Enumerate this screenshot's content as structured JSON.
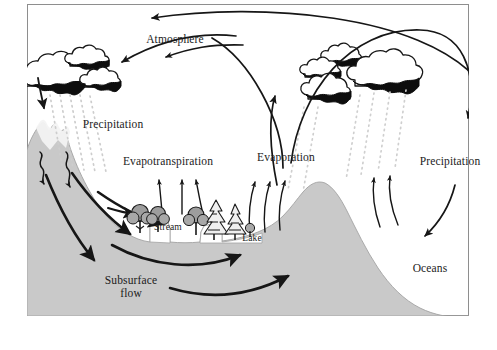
{
  "figure": {
    "type": "hydrologic-cycle-diagram",
    "border_color": "#8c8c8c",
    "background_color": "#ffffff",
    "ground_fill": "#c9c9c9",
    "ground_stroke": "#9a9a9a",
    "ink_color": "#161616",
    "precip_dot_color": "#cfcfcf"
  },
  "labels": {
    "atmosphere": "Atmosphere",
    "precipitation_left": "Precipitation",
    "evapotranspiration": "Evapotranspiration",
    "evaporation": "Evaporation",
    "precipitation_right": "Precipitation",
    "stream": "Stream",
    "lake": "Lake",
    "oceans": "Oceans",
    "subsurface_flow_line1": "Subsurface",
    "subsurface_flow_line2": "flow"
  },
  "elements": {
    "clouds_left_count": 3,
    "clouds_right_count": 4,
    "trees_count": 6,
    "precip_streaks_left": 5,
    "precip_streaks_right": 6,
    "evaporation_arrows_lake": 3,
    "evaporation_arrows_ocean": 3,
    "evapotranspiration_arrows": 3,
    "subsurface_flow_arrows": 5,
    "infiltration_arrows": 2,
    "transport_arcs": 4
  },
  "processes": [
    {
      "name": "Atmosphere",
      "kind": "reservoir"
    },
    {
      "name": "Precipitation",
      "kind": "flux",
      "location": "mountain"
    },
    {
      "name": "Evapotranspiration",
      "kind": "flux",
      "location": "vegetation"
    },
    {
      "name": "Evaporation",
      "kind": "flux",
      "location": "lake-and-ocean"
    },
    {
      "name": "Precipitation",
      "kind": "flux",
      "location": "ocean"
    },
    {
      "name": "Stream",
      "kind": "reservoir"
    },
    {
      "name": "Lake",
      "kind": "reservoir"
    },
    {
      "name": "Oceans",
      "kind": "reservoir"
    },
    {
      "name": "Subsurface flow",
      "kind": "flux",
      "location": "ground"
    }
  ]
}
